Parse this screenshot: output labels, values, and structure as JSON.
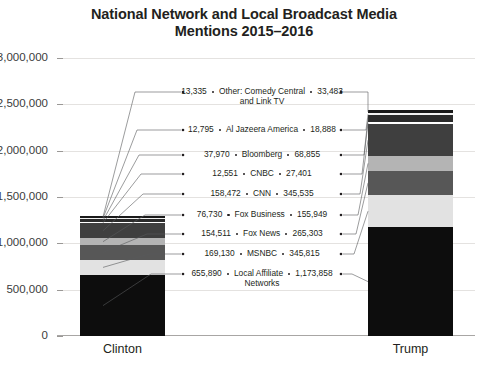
{
  "chart_data": {
    "type": "bar",
    "title": "National Network and Local Broadcast Media\nMentions 2015–2016",
    "xlabel": "",
    "ylabel": "",
    "categories": [
      "Clinton",
      "Trump"
    ],
    "ylim": [
      0,
      3000000
    ],
    "ytick_labels": [
      "0",
      "500,000",
      "1,000,000",
      "1,500,000",
      "2,000,000",
      "2,500,000",
      "3,000,000"
    ],
    "ytick_values": [
      0,
      500000,
      1000000,
      1500000,
      2000000,
      2500000,
      3000000
    ],
    "grid": true,
    "legend": "none",
    "stacked": true,
    "series": [
      {
        "name": "Local Affiliate Networks",
        "label_lines": [
          "Local Affiliate",
          "Networks"
        ],
        "values": [
          655890,
          1173858
        ],
        "value_labels": [
          "655,890",
          "1,173,858"
        ],
        "color": "#0d0d0d"
      },
      {
        "name": "MSNBC",
        "label_lines": [
          "MSNBC"
        ],
        "values": [
          169130,
          345815
        ],
        "value_labels": [
          "169,130",
          "345,815"
        ],
        "color": "#e2e2e2"
      },
      {
        "name": "Fox News",
        "label_lines": [
          "Fox News"
        ],
        "values": [
          154511,
          265303
        ],
        "value_labels": [
          "154,511",
          "265,303"
        ],
        "color": "#575757"
      },
      {
        "name": "Fox Business",
        "label_lines": [
          "Fox Business"
        ],
        "values": [
          76730,
          155949
        ],
        "value_labels": [
          "76,730",
          "155,949"
        ],
        "color": "#b4b4b4"
      },
      {
        "name": "CNN",
        "label_lines": [
          "CNN"
        ],
        "values": [
          158472,
          345535
        ],
        "value_labels": [
          "158,472",
          "345,535"
        ],
        "color": "#3f3f3f"
      },
      {
        "name": "CNBC",
        "label_lines": [
          "CNBC"
        ],
        "values": [
          12551,
          27401
        ],
        "value_labels": [
          "12,551",
          "27,401"
        ],
        "color": "#ffffff"
      },
      {
        "name": "Bloomberg",
        "label_lines": [
          "Bloomberg"
        ],
        "values": [
          37970,
          68855
        ],
        "value_labels": [
          "37,970",
          "68,855"
        ],
        "color": "#2b2b2b"
      },
      {
        "name": "Al Jazeera America",
        "label_lines": [
          "Al Jazeera America"
        ],
        "values": [
          12795,
          18888
        ],
        "value_labels": [
          "12,795",
          "18,888"
        ],
        "color": "#f2f2f2"
      },
      {
        "name": "Other: Comedy Central and Link TV",
        "label_lines": [
          "Other: Comedy Central",
          "and Link TV"
        ],
        "values": [
          13335,
          33483
        ],
        "value_labels": [
          "13,335",
          "33,483"
        ],
        "color": "#1a1a1a"
      }
    ],
    "totals": [
      1291384,
      2435087
    ]
  }
}
